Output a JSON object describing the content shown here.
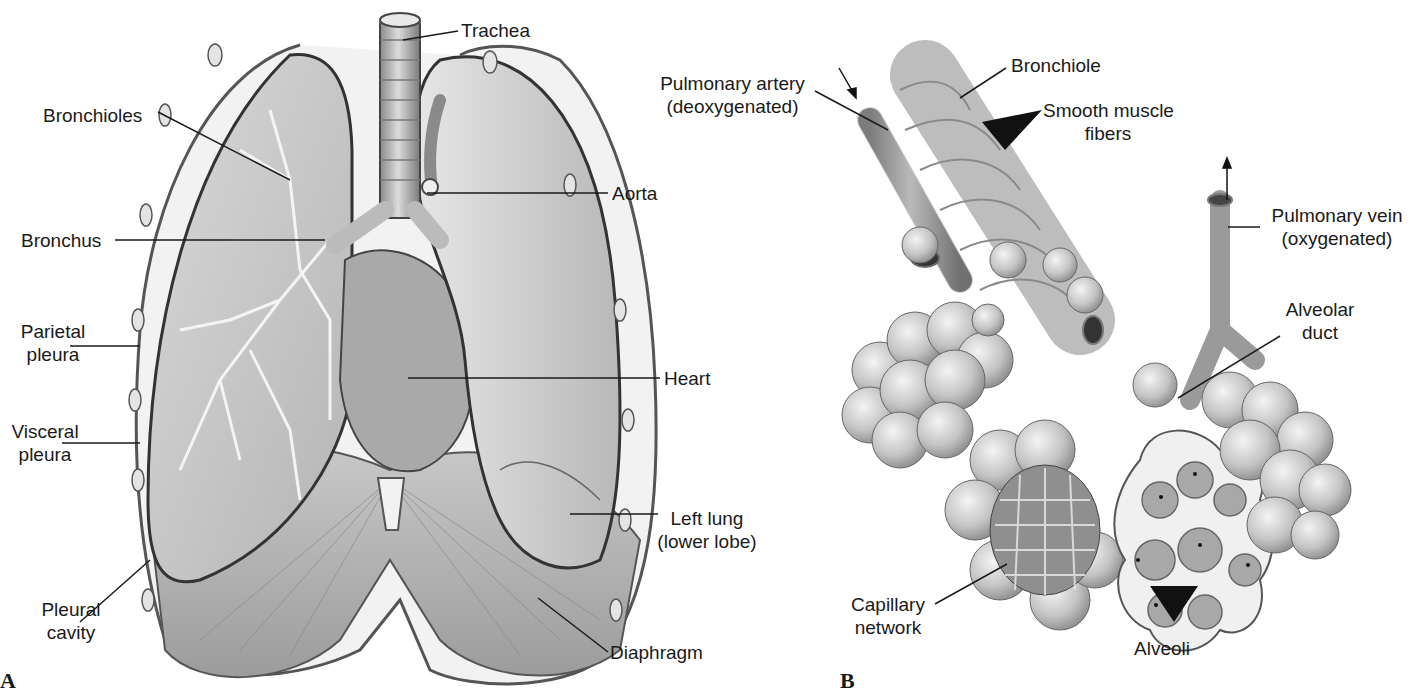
{
  "figure": {
    "panels": [
      {
        "letter": "A",
        "subject": "Lungs and thoracic cavity (anterior view)",
        "labels": [
          {
            "id": "trachea",
            "text": "Trachea"
          },
          {
            "id": "bronchioles",
            "text": "Bronchioles"
          },
          {
            "id": "aorta",
            "text": "Aorta"
          },
          {
            "id": "bronchus",
            "text": "Bronchus"
          },
          {
            "id": "parietal_pleura",
            "line1": "Parietal",
            "line2": "pleura"
          },
          {
            "id": "heart",
            "text": "Heart"
          },
          {
            "id": "visceral_pleura",
            "line1": "Visceral",
            "line2": "pleura"
          },
          {
            "id": "left_lung",
            "line1": "Left lung",
            "line2": "(lower lobe)"
          },
          {
            "id": "pleural_cavity",
            "line1": "Pleural",
            "line2": "cavity"
          },
          {
            "id": "diaphragm",
            "text": "Diaphragm"
          }
        ]
      },
      {
        "letter": "B",
        "subject": "Bronchiole, alveoli and pulmonary vessels",
        "labels": [
          {
            "id": "pulmonary_artery",
            "line1": "Pulmonary artery",
            "line2": "(deoxygenated)"
          },
          {
            "id": "bronchiole",
            "text": "Bronchiole"
          },
          {
            "id": "smooth_muscle",
            "line1": "Smooth muscle",
            "line2": "fibers"
          },
          {
            "id": "pulmonary_vein",
            "line1": "Pulmonary vein",
            "line2": "(oxygenated)"
          },
          {
            "id": "alveolar_duct",
            "line1": "Alveolar",
            "line2": "duct"
          },
          {
            "id": "capillary_network",
            "line1": "Capillary",
            "line2": "network"
          },
          {
            "id": "alveoli",
            "text": "Alveoli"
          }
        ]
      }
    ]
  },
  "colors": {
    "background": "#ffffff",
    "ink": "#1a1a1a",
    "tissue_light": "#e4e4e4",
    "tissue_mid": "#bdbdbd",
    "tissue_dark": "#7a7a7a"
  }
}
